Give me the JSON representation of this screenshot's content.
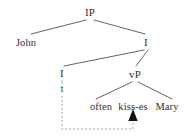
{
  "figure": {
    "kind": "syntax-tree",
    "background_color": "#ffffff",
    "line_color": "#55504e",
    "text_color": "#33302f",
    "movement_arrow_color": "#9c9794"
  },
  "tree": {
    "root": {
      "label": "IP",
      "x": 90,
      "y": 12
    },
    "nodes": [
      {
        "id": "ip",
        "label": "IP",
        "x": 90,
        "y": 12,
        "kind": "phrase"
      },
      {
        "id": "john",
        "label": "John",
        "x": 26,
        "y": 42,
        "kind": "terminal"
      },
      {
        "id": "i-bar",
        "label": "I",
        "x": 146,
        "y": 42,
        "kind": "phrase"
      },
      {
        "id": "i-head",
        "label": "I",
        "x": 62,
        "y": 73,
        "kind": "head"
      },
      {
        "id": "trace",
        "label": "t",
        "x": 62,
        "y": 89,
        "kind": "trace"
      },
      {
        "id": "vp",
        "label": "vP",
        "x": 135,
        "y": 74,
        "kind": "phrase"
      },
      {
        "id": "often",
        "label": "often",
        "x": 101,
        "y": 106,
        "kind": "terminal"
      },
      {
        "id": "kisses",
        "label": "kiss-es",
        "x": 133,
        "y": 106,
        "kind": "terminal"
      },
      {
        "id": "mary",
        "label": "Mary",
        "x": 167,
        "y": 106,
        "kind": "terminal"
      }
    ],
    "edges": [
      {
        "from": "ip",
        "to": "john",
        "x1": 86,
        "y1": 20,
        "x2": 31,
        "y2": 34
      },
      {
        "from": "ip",
        "to": "i-bar",
        "x1": 94,
        "y1": 20,
        "x2": 145,
        "y2": 34
      },
      {
        "from": "i-bar",
        "to": "i-head",
        "x1": 144,
        "y1": 50,
        "x2": 64,
        "y2": 66
      },
      {
        "from": "i-bar",
        "to": "vp",
        "x1": 148,
        "y1": 50,
        "x2": 136,
        "y2": 66
      },
      {
        "from": "vp",
        "to": "often",
        "x1": 132,
        "y1": 82,
        "x2": 96,
        "y2": 99
      },
      {
        "from": "vp",
        "to": "mary",
        "x1": 138,
        "y1": 82,
        "x2": 172,
        "y2": 99
      }
    ],
    "movement": {
      "description": "head-movement arrow from verb to I",
      "from_node": "kisses",
      "to_node": "trace",
      "path": "M 62 96 L 62 129 L 133 129 L 133 120",
      "arrowhead_x": 133,
      "arrowhead_y": 109,
      "dashed": true
    }
  }
}
